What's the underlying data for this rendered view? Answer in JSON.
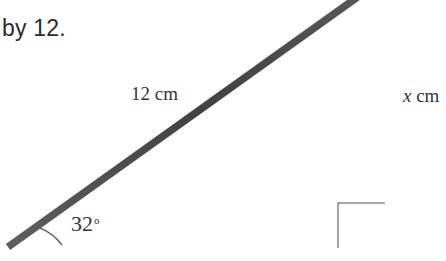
{
  "document": {
    "prose_line": "by 12."
  },
  "figure": {
    "type": "right-triangle",
    "hypotenuse_label": "12 cm",
    "vertical_side_variable": "x",
    "vertical_side_unit": " cm",
    "angle_value": "32",
    "angle_degree_symbol": "o",
    "right_angle_marker": "right-angle-square",
    "colors": {
      "stroke": "#4a4a4a",
      "right_angle_stroke": "#8d8d8d",
      "arc_stroke": "#6b6b6b",
      "text": "#343434",
      "background": "#ffffff"
    },
    "geometry": {
      "left_vertex": [
        8,
        248
      ],
      "right_vertex": [
        389,
        248
      ],
      "base_y": 248,
      "vertical_x": 389,
      "hypotenuse_exit_top": [
        362,
        0
      ],
      "stroke_width": 7,
      "right_angle_box": [
        338,
        203,
        47,
        45
      ],
      "arc_radius": 50
    }
  }
}
